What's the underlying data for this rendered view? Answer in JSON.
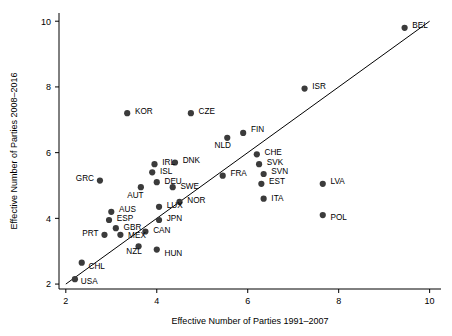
{
  "chart_data": {
    "type": "scatter",
    "title": "",
    "xlabel": "Effective Number of Parties 1991–2007",
    "ylabel": "Effective Number of Parties 2008–2016",
    "xlim": [
      1.85,
      10.25
    ],
    "ylim": [
      1.85,
      10.25
    ],
    "xticks": [
      2,
      4,
      6,
      8,
      10
    ],
    "yticks": [
      2,
      4,
      6,
      8,
      10
    ],
    "xticklabels": [
      "2",
      "4",
      "6",
      "8",
      "10"
    ],
    "yticklabels": [
      "2",
      "4",
      "6",
      "8",
      "10"
    ],
    "grid": false,
    "legend": "none",
    "annotations": [
      {
        "text": "y = x reference line",
        "from": [
          2,
          2
        ],
        "to": [
          10,
          10
        ]
      }
    ],
    "points": [
      {
        "label": "BEL",
        "x": 9.45,
        "y": 9.8,
        "lx": 9.62,
        "ly": 9.88,
        "anchor": "start"
      },
      {
        "label": "ISR",
        "x": 7.25,
        "y": 7.95,
        "lx": 7.42,
        "ly": 8.03,
        "anchor": "start"
      },
      {
        "label": "KOR",
        "x": 3.35,
        "y": 7.2,
        "lx": 3.52,
        "ly": 7.28,
        "anchor": "start"
      },
      {
        "label": "CZE",
        "x": 4.75,
        "y": 7.2,
        "lx": 4.92,
        "ly": 7.28,
        "anchor": "start"
      },
      {
        "label": "FIN",
        "x": 5.9,
        "y": 6.6,
        "lx": 6.07,
        "ly": 6.72,
        "anchor": "start"
      },
      {
        "label": "NLD",
        "x": 5.55,
        "y": 6.45,
        "lx": 5.45,
        "ly": 6.22,
        "anchor": "middle"
      },
      {
        "label": "CHE",
        "x": 6.2,
        "y": 5.95,
        "lx": 6.37,
        "ly": 6.03,
        "anchor": "start"
      },
      {
        "label": "SVK",
        "x": 6.25,
        "y": 5.65,
        "lx": 6.42,
        "ly": 5.73,
        "anchor": "start"
      },
      {
        "label": "DNK",
        "x": 4.4,
        "y": 5.7,
        "lx": 4.57,
        "ly": 5.78,
        "anchor": "start"
      },
      {
        "label": "IRL",
        "x": 3.95,
        "y": 5.65,
        "lx": 4.12,
        "ly": 5.73,
        "anchor": "start"
      },
      {
        "label": "ISL",
        "x": 3.9,
        "y": 5.4,
        "lx": 4.07,
        "ly": 5.45,
        "anchor": "start"
      },
      {
        "label": "DEU",
        "x": 4.0,
        "y": 5.1,
        "lx": 4.17,
        "ly": 5.15,
        "anchor": "start"
      },
      {
        "label": "SWE",
        "x": 4.35,
        "y": 4.95,
        "lx": 4.52,
        "ly": 5.0,
        "anchor": "start"
      },
      {
        "label": "AUT",
        "x": 3.65,
        "y": 4.95,
        "lx": 3.53,
        "ly": 4.72,
        "anchor": "middle"
      },
      {
        "label": "GRC",
        "x": 2.75,
        "y": 5.15,
        "lx": 2.62,
        "ly": 5.23,
        "anchor": "end"
      },
      {
        "label": "FRA",
        "x": 5.45,
        "y": 5.3,
        "lx": 5.62,
        "ly": 5.38,
        "anchor": "start"
      },
      {
        "label": "SVN",
        "x": 6.35,
        "y": 5.35,
        "lx": 6.52,
        "ly": 5.43,
        "anchor": "start"
      },
      {
        "label": "EST",
        "x": 6.3,
        "y": 5.05,
        "lx": 6.47,
        "ly": 5.13,
        "anchor": "start"
      },
      {
        "label": "LVA",
        "x": 7.65,
        "y": 5.05,
        "lx": 7.82,
        "ly": 5.13,
        "anchor": "start"
      },
      {
        "label": "ITA",
        "x": 6.35,
        "y": 4.6,
        "lx": 6.52,
        "ly": 4.62,
        "anchor": "start"
      },
      {
        "label": "NOR",
        "x": 4.5,
        "y": 4.5,
        "lx": 4.67,
        "ly": 4.55,
        "anchor": "start"
      },
      {
        "label": "LUX",
        "x": 4.05,
        "y": 4.35,
        "lx": 4.22,
        "ly": 4.4,
        "anchor": "start"
      },
      {
        "label": "POL",
        "x": 7.65,
        "y": 4.1,
        "lx": 7.82,
        "ly": 4.05,
        "anchor": "start"
      },
      {
        "label": "AUS",
        "x": 3.0,
        "y": 4.2,
        "lx": 3.17,
        "ly": 4.28,
        "anchor": "start"
      },
      {
        "label": "ESP",
        "x": 2.95,
        "y": 3.95,
        "lx": 3.12,
        "ly": 4.0,
        "anchor": "start"
      },
      {
        "label": "JPN",
        "x": 4.05,
        "y": 3.95,
        "lx": 4.22,
        "ly": 4.0,
        "anchor": "start"
      },
      {
        "label": "GBR",
        "x": 3.1,
        "y": 3.7,
        "lx": 3.27,
        "ly": 3.75,
        "anchor": "start"
      },
      {
        "label": "CAN",
        "x": 3.75,
        "y": 3.6,
        "lx": 3.92,
        "ly": 3.65,
        "anchor": "start"
      },
      {
        "label": "PRT",
        "x": 2.85,
        "y": 3.5,
        "lx": 2.72,
        "ly": 3.55,
        "anchor": "end"
      },
      {
        "label": "MEX",
        "x": 3.2,
        "y": 3.5,
        "lx": 3.37,
        "ly": 3.48,
        "anchor": "start"
      },
      {
        "label": "NZL",
        "x": 3.6,
        "y": 3.15,
        "lx": 3.5,
        "ly": 3.0,
        "anchor": "middle"
      },
      {
        "label": "HUN",
        "x": 4.0,
        "y": 3.05,
        "lx": 4.17,
        "ly": 2.95,
        "anchor": "start"
      },
      {
        "label": "CHL",
        "x": 2.35,
        "y": 2.65,
        "lx": 2.5,
        "ly": 2.55,
        "anchor": "start"
      },
      {
        "label": "USA",
        "x": 2.2,
        "y": 2.15,
        "lx": 2.33,
        "ly": 2.08,
        "anchor": "start"
      }
    ]
  }
}
